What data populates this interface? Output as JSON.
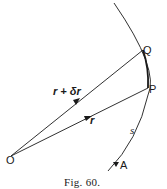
{
  "figure": {
    "caption": "Fig. 60.",
    "points": {
      "O": "O",
      "P": "P",
      "Q": "Q",
      "A": "A"
    },
    "vectors": {
      "r": "r",
      "r_plus_delta_r": "r + δr"
    },
    "arc_label": "s",
    "colors": {
      "ink": "#1a1a1a",
      "background": "#ffffff"
    }
  }
}
